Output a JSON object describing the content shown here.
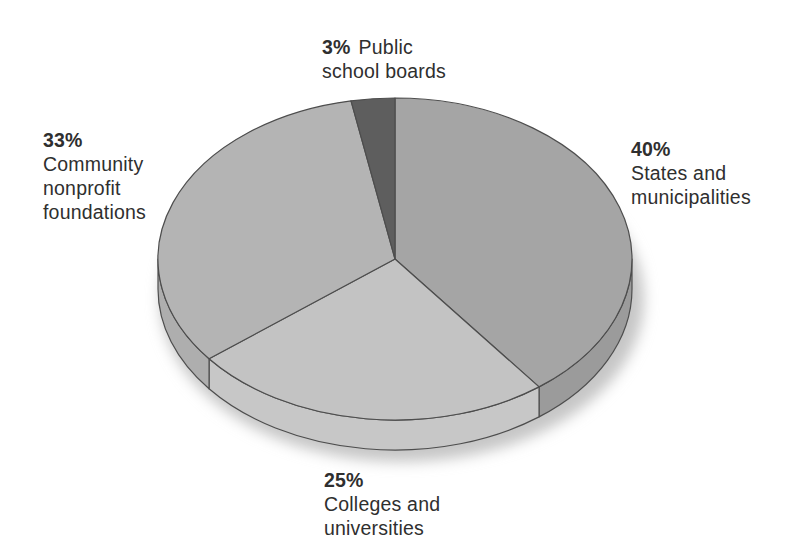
{
  "chart_data": {
    "type": "pie",
    "projection": "3d",
    "direction": "clockwise",
    "start_angle_deg": 0,
    "title": "",
    "background": "#ffffff",
    "outline_color": "#4d4d4d",
    "shadow_color": "#c6c6c6",
    "text_color": "#2f2f2f",
    "slices": [
      {
        "name": "states-and-municipalities",
        "pct": 40,
        "pct_text": "40%",
        "label_lines": [
          "States and",
          "municipalities"
        ],
        "top_color": "#a5a5a5",
        "side_color": "#9b9b9b"
      },
      {
        "name": "colleges-and-universities",
        "pct": 25,
        "pct_text": "25%",
        "label_lines": [
          "Colleges and",
          "universities"
        ],
        "top_color": "#c3c3c3",
        "side_color": "#c7c7c7"
      },
      {
        "name": "community-nonprofit-foundations",
        "pct": 33,
        "pct_text": "33%",
        "label_lines": [
          "Community",
          "nonprofit",
          "foundations"
        ],
        "top_color": "#b4b4b4",
        "side_color": "#aeaeae"
      },
      {
        "name": "public-school-boards",
        "pct": 3,
        "pct_text": "3%",
        "label_lines": [
          "Public",
          "school boards"
        ],
        "top_color": "#5e5e5e",
        "side_color": "#565656"
      }
    ]
  }
}
